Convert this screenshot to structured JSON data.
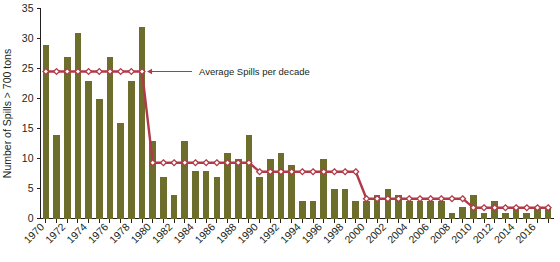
{
  "chart_data": {
    "type": "bar",
    "title": "",
    "subtitle": "",
    "xlabel": "",
    "ylabel": "Number of Spills > 700 tons",
    "ylim": [
      0,
      35
    ],
    "yticks": [
      0,
      5,
      10,
      15,
      20,
      25,
      30,
      35
    ],
    "ytick_labels": [
      "0",
      "5",
      "10",
      "15",
      "20",
      "25",
      "30",
      "35"
    ],
    "grid": false,
    "legend_position": "none",
    "bar_color": "#6d6e2c",
    "line_color": "#b03a48",
    "marker_face_color": "#ffffff",
    "categories": [
      "1970",
      "1971",
      "1972",
      "1973",
      "1974",
      "1975",
      "1976",
      "1977",
      "1978",
      "1979",
      "1980",
      "1981",
      "1982",
      "1983",
      "1984",
      "1985",
      "1986",
      "1987",
      "1988",
      "1989",
      "1990",
      "1991",
      "1992",
      "1993",
      "1994",
      "1995",
      "1996",
      "1997",
      "1998",
      "1999",
      "2000",
      "2001",
      "2002",
      "2003",
      "2004",
      "2005",
      "2006",
      "2007",
      "2008",
      "2009",
      "2010",
      "2011",
      "2012",
      "2013",
      "2014",
      "2015",
      "2016",
      "2017"
    ],
    "xtick_labels_shown": [
      "1970",
      "1972",
      "1974",
      "1976",
      "1978",
      "1980",
      "1982",
      "1984",
      "1986",
      "1988",
      "1990",
      "1992",
      "1994",
      "1996",
      "1998",
      "2000",
      "2002",
      "2004",
      "2006",
      "2008",
      "2010",
      "2012",
      "2014",
      "2016"
    ],
    "values": [
      29,
      14,
      27,
      31,
      23,
      20,
      27,
      16,
      23,
      32,
      13,
      7,
      4,
      13,
      8,
      8,
      7,
      11,
      10,
      14,
      7,
      10,
      11,
      9,
      3,
      3,
      10,
      5,
      5,
      3,
      3,
      4,
      5,
      4,
      3,
      3,
      3,
      3,
      1,
      2,
      4,
      1,
      3,
      1,
      2,
      1,
      2,
      2
    ],
    "series": [
      {
        "name": "Number of Spills > 700 tons",
        "type": "bar",
        "values": [
          29,
          14,
          27,
          31,
          23,
          20,
          27,
          16,
          23,
          32,
          13,
          7,
          4,
          13,
          8,
          8,
          7,
          11,
          10,
          14,
          7,
          10,
          11,
          9,
          3,
          3,
          10,
          5,
          5,
          3,
          3,
          4,
          5,
          4,
          3,
          3,
          3,
          3,
          1,
          2,
          4,
          1,
          3,
          1,
          2,
          1,
          2,
          2
        ]
      },
      {
        "name": "Average Spills per decade",
        "type": "line",
        "values": [
          24.5,
          24.5,
          24.5,
          24.5,
          24.5,
          24.5,
          24.5,
          24.5,
          24.5,
          24.5,
          9.3,
          9.3,
          9.3,
          9.3,
          9.3,
          9.3,
          9.3,
          9.3,
          9.3,
          9.3,
          7.8,
          7.8,
          7.8,
          7.8,
          7.8,
          7.8,
          7.8,
          7.8,
          7.8,
          7.8,
          3.3,
          3.3,
          3.3,
          3.3,
          3.3,
          3.3,
          3.3,
          3.3,
          3.3,
          3.3,
          1.8,
          1.8,
          1.8,
          1.8,
          1.8,
          1.8,
          1.8,
          1.8
        ]
      }
    ],
    "decade_averages": [
      {
        "decade": "1970s",
        "value": 24.5
      },
      {
        "decade": "1980s",
        "value": 9.3
      },
      {
        "decade": "1990s",
        "value": 7.8
      },
      {
        "decade": "2000s",
        "value": 3.3
      },
      {
        "decade": "2010s",
        "value": 1.8
      }
    ],
    "annotations": [
      {
        "name": "average-spills-annotation",
        "text": "Average Spills per decade"
      }
    ]
  }
}
